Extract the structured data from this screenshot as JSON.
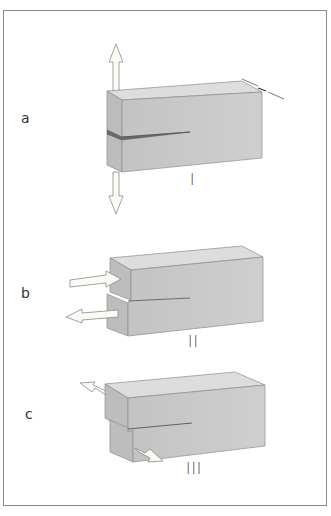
{
  "figure": {
    "colors": {
      "block_front": "#c9c9c9",
      "block_top": "#dcdcdc",
      "block_side": "#b9b9b9",
      "edge": "#8c8c8c",
      "crack": "#555555",
      "arrow_fill": "#fbfbf6",
      "arrow_stroke": "#8a8a8a",
      "frame": "#8a8a8a"
    },
    "panels": [
      {
        "label": "a",
        "mode": "I",
        "description": "Opening mode: tensile forces perpendicular to crack plane (vertical arrows up and down)"
      },
      {
        "label": "b",
        "mode": "II",
        "description": "Sliding mode: in-plane shear (horizontal arrows in opposite directions)"
      },
      {
        "label": "c",
        "mode": "III",
        "description": "Tearing mode: out-of-plane shear (arrows in opposite lateral directions)"
      }
    ]
  }
}
